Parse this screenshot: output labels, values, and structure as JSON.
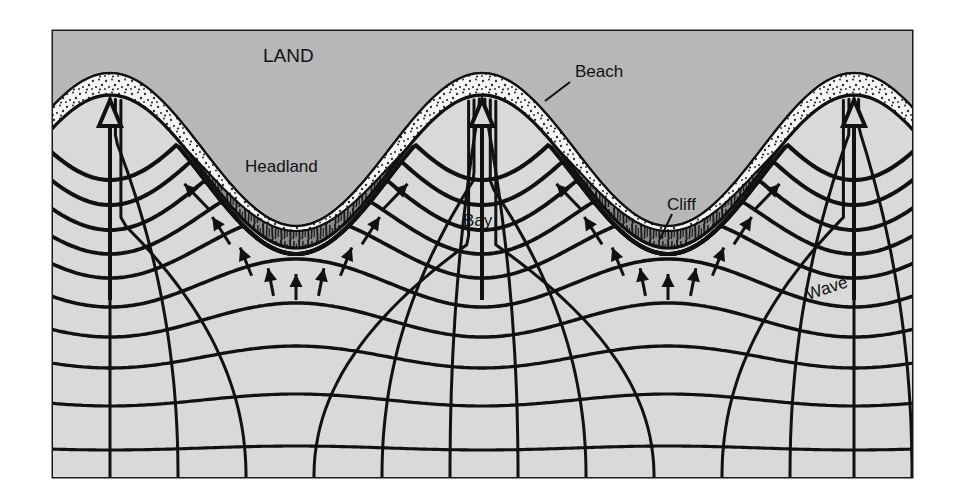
{
  "figure": {
    "kind": "wave-refraction-coastal-diagram",
    "frame": {
      "x": 53,
      "y": 31,
      "width": 859,
      "height": 446
    }
  },
  "colors": {
    "page_background": "#ffffff",
    "land_fill": "#b7b7b7",
    "sea_fill": "#d9d9d9",
    "beach_fill": "#f2f2f2",
    "cliff_fill": "#8a8a8a",
    "line": "#111111",
    "frame": "#1a1a1a"
  },
  "labels": {
    "land": {
      "text": "LAND",
      "x": 263,
      "y": 62,
      "size": 19,
      "weight": "400",
      "rotate": 0,
      "leader": null
    },
    "headland": {
      "text": "Headland",
      "x": 245,
      "y": 172,
      "size": 17,
      "weight": "400",
      "rotate": 0,
      "leader": null
    },
    "bay": {
      "text": "Bay",
      "x": 463,
      "y": 226,
      "size": 17,
      "weight": "400",
      "rotate": 0,
      "leader": null
    },
    "beach": {
      "text": "Beach",
      "x": 575,
      "y": 77,
      "size": 17,
      "weight": "400",
      "rotate": 0,
      "leader": {
        "x1": 570,
        "y1": 82,
        "x2": 545,
        "y2": 101
      }
    },
    "cliff": {
      "text": "Cliff",
      "x": 667,
      "y": 210,
      "size": 17,
      "weight": "400",
      "rotate": 0,
      "leader": {
        "x1": 672,
        "y1": 214,
        "x2": 660,
        "y2": 239
      }
    },
    "wave": {
      "text": "Wave",
      "x": 808,
      "y": 300,
      "size": 17,
      "weight": "400",
      "rotate": -18,
      "leader": null
    }
  },
  "geometry": {
    "coast": {
      "description": "Shoreline: three headland crests and two bay troughs across the frame",
      "headland_crest_x": [
        110,
        482,
        854
      ],
      "bay_trough_x": [
        296,
        668
      ],
      "crest_y": 95,
      "trough_y": 248,
      "beach_band_thickness": 22,
      "cliff_band_thickness": 17
    },
    "wave_crests": {
      "count": 10,
      "description": "Crest lines refract: bulge upward over bays, flatten toward the open sea at the bottom",
      "base_y": [
        118,
        150,
        182,
        214,
        246,
        283,
        320,
        357,
        400,
        448
      ],
      "amplitude": [
        62,
        55,
        48,
        40,
        32,
        24,
        17,
        11,
        6,
        2
      ]
    },
    "orthogonals": {
      "count": 13,
      "description": "Wave rays perpendicular to crests, converging on headlands, diverging in bays",
      "bottom_x": [
        110,
        178,
        246,
        314,
        382,
        450,
        518,
        586,
        654,
        722,
        790,
        854,
        912
      ]
    },
    "arrows": {
      "headland_major": [
        {
          "x": 110,
          "tail_y": 300,
          "head_y": 100,
          "style": "outline"
        },
        {
          "x": 482,
          "tail_y": 300,
          "head_y": 100,
          "style": "outline"
        },
        {
          "x": 854,
          "tail_y": 300,
          "head_y": 100,
          "style": "outline"
        }
      ],
      "bay_convergent_count": 18,
      "bay_convergent_style": "solid-barbed",
      "note": "Small barbed arrows along the two bay troughs point inward/upward toward the shore"
    }
  }
}
